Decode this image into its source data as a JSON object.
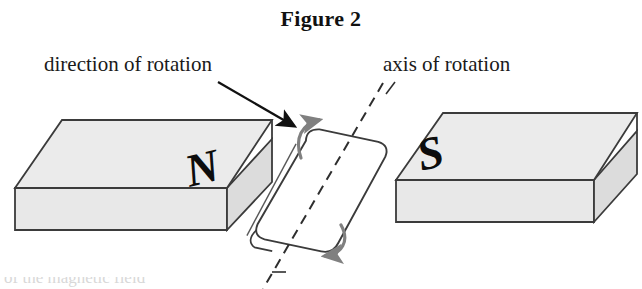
{
  "figure": {
    "title": "Figure 2",
    "labels": {
      "direction_of_rotation": "direction of rotation",
      "axis_of_rotation": "axis of rotation"
    },
    "poles": {
      "left": "N",
      "right": "S"
    },
    "cut_off_caption": "of the magnetic field",
    "colors": {
      "face_top": "#ebebeb",
      "face_front": "#e8e8e8",
      "face_side": "#dcdcdc",
      "outline": "#3b3b3b",
      "pointer_arrow": "#111111",
      "rotation_arrow": "#808080",
      "background": "#ffffff",
      "text": "#1a1a1a"
    },
    "elements": {
      "left_magnet_name": "north-pole-magnet-block",
      "right_magnet_name": "south-pole-magnet-block",
      "rotor_name": "rotating-vane",
      "axis_name": "axis-of-rotation-dashed-line",
      "pointer_name": "direction-pointer-arrow",
      "top_curve_name": "rotation-arrow-top",
      "bottom_curve_name": "rotation-arrow-bottom"
    }
  }
}
